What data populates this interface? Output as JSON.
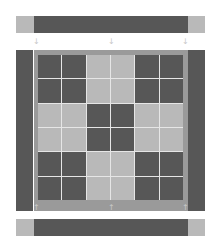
{
  "colors": {
    "dark": "#575757",
    "light": "#b9b9b9",
    "frame": "#9a9a9a",
    "gridline": "#e6e6e6",
    "marker": "#c8c8c8"
  },
  "top_bar": {
    "segments": [
      "light",
      "dark",
      "light"
    ]
  },
  "bottom_bar": {
    "segments": [
      "light",
      "dark",
      "light"
    ]
  },
  "side_bars": {
    "left": "dark",
    "right": "dark"
  },
  "markers": {
    "top": {
      "glyph": "↓",
      "positions": [
        "left",
        "center",
        "right"
      ]
    },
    "bottom": {
      "glyph": "↑",
      "positions": [
        "left",
        "center",
        "right"
      ]
    }
  },
  "grid": {
    "rows": 6,
    "cols": 6,
    "cells": [
      [
        "dark",
        "dark",
        "light",
        "light",
        "dark",
        "dark"
      ],
      [
        "dark",
        "dark",
        "light",
        "light",
        "dark",
        "dark"
      ],
      [
        "light",
        "light",
        "dark",
        "dark",
        "light",
        "light"
      ],
      [
        "light",
        "light",
        "dark",
        "dark",
        "light",
        "light"
      ],
      [
        "dark",
        "dark",
        "light",
        "light",
        "dark",
        "dark"
      ],
      [
        "dark",
        "dark",
        "light",
        "light",
        "dark",
        "dark"
      ]
    ]
  }
}
